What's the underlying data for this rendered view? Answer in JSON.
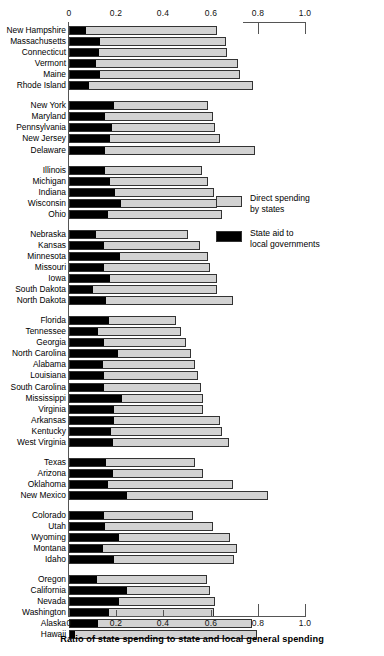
{
  "chart_data": {
    "type": "bar",
    "orientation": "horizontal",
    "stacked": true,
    "title": "",
    "xlabel": "Ratio of state spending to state and local general spending",
    "ylabel": "",
    "xlim": [
      0,
      1.0
    ],
    "xticks": [
      0,
      0.2,
      0.4,
      0.6,
      0.8,
      1.0
    ],
    "xticklabels": [
      "0",
      "0.2",
      "0.4",
      "0.6",
      "0.8",
      "1.0"
    ],
    "grid": false,
    "legend_position": "right-middle",
    "series": [
      {
        "name": "Direct spending by states",
        "color": "#d2d2d2"
      },
      {
        "name": "State aid to local governments",
        "color": "#000000"
      }
    ],
    "groups": [
      {
        "name": "New England",
        "rows": [
          {
            "label": "New Hampshire",
            "aid": 0.068,
            "total": 0.627
          },
          {
            "label": "Massachusetts",
            "aid": 0.13,
            "total": 0.665
          },
          {
            "label": "Connecticut",
            "aid": 0.123,
            "total": 0.669
          },
          {
            "label": "Vermont",
            "aid": 0.11,
            "total": 0.716
          },
          {
            "label": "Maine",
            "aid": 0.13,
            "total": 0.724
          },
          {
            "label": "Rhode Island",
            "aid": 0.08,
            "total": 0.78
          }
        ]
      },
      {
        "name": "Mid-Atlantic",
        "rows": [
          {
            "label": "New York",
            "aid": 0.19,
            "total": 0.59
          },
          {
            "label": "Maryland",
            "aid": 0.15,
            "total": 0.61
          },
          {
            "label": "Pennsylvania",
            "aid": 0.18,
            "total": 0.62
          },
          {
            "label": "New Jersey",
            "aid": 0.17,
            "total": 0.64
          },
          {
            "label": "Delaware",
            "aid": 0.15,
            "total": 0.79
          }
        ]
      },
      {
        "name": "Great Lakes",
        "rows": [
          {
            "label": "Illinois",
            "aid": 0.15,
            "total": 0.565
          },
          {
            "label": "Michigan",
            "aid": 0.17,
            "total": 0.59
          },
          {
            "label": "Indiana",
            "aid": 0.195,
            "total": 0.615
          },
          {
            "label": "Wisconsin",
            "aid": 0.22,
            "total": 0.625
          },
          {
            "label": "Ohio",
            "aid": 0.165,
            "total": 0.65
          }
        ]
      },
      {
        "name": "Plains",
        "rows": [
          {
            "label": "Nebraska",
            "aid": 0.11,
            "total": 0.504
          },
          {
            "label": "Kansas",
            "aid": 0.145,
            "total": 0.555
          },
          {
            "label": "Minnesota",
            "aid": 0.216,
            "total": 0.59
          },
          {
            "label": "Missouri",
            "aid": 0.145,
            "total": 0.597
          },
          {
            "label": "Iowa",
            "aid": 0.17,
            "total": 0.627
          },
          {
            "label": "South Dakota",
            "aid": 0.097,
            "total": 0.627
          },
          {
            "label": "North Dakota",
            "aid": 0.153,
            "total": 0.695
          }
        ]
      },
      {
        "name": "South",
        "rows": [
          {
            "label": "Florida",
            "aid": 0.17,
            "total": 0.453
          },
          {
            "label": "Tennessee",
            "aid": 0.12,
            "total": 0.475
          },
          {
            "label": "Georgia",
            "aid": 0.148,
            "total": 0.495
          },
          {
            "label": "North Carolina",
            "aid": 0.205,
            "total": 0.515
          },
          {
            "label": "Alabama",
            "aid": 0.14,
            "total": 0.535
          },
          {
            "label": "Louisiana",
            "aid": 0.148,
            "total": 0.545
          },
          {
            "label": "South Carolina",
            "aid": 0.148,
            "total": 0.56
          },
          {
            "label": "Mississippi",
            "aid": 0.222,
            "total": 0.568
          },
          {
            "label": "Virginia",
            "aid": 0.19,
            "total": 0.568
          },
          {
            "label": "Arkansas",
            "aid": 0.19,
            "total": 0.64
          },
          {
            "label": "Kentucky",
            "aid": 0.178,
            "total": 0.65
          },
          {
            "label": "West Virginia",
            "aid": 0.185,
            "total": 0.678
          }
        ]
      },
      {
        "name": "Southwest",
        "rows": [
          {
            "label": "Texas",
            "aid": 0.153,
            "total": 0.534
          },
          {
            "label": "Arizona",
            "aid": 0.186,
            "total": 0.568
          },
          {
            "label": "Oklahoma",
            "aid": 0.165,
            "total": 0.695
          },
          {
            "label": "New Mexico",
            "aid": 0.246,
            "total": 0.843
          }
        ]
      },
      {
        "name": "Mountain",
        "rows": [
          {
            "label": "Colorado",
            "aid": 0.145,
            "total": 0.525
          },
          {
            "label": "Utah",
            "aid": 0.15,
            "total": 0.61
          },
          {
            "label": "Wyoming",
            "aid": 0.21,
            "total": 0.68
          },
          {
            "label": "Montana",
            "aid": 0.143,
            "total": 0.71
          },
          {
            "label": "Idaho",
            "aid": 0.19,
            "total": 0.7
          }
        ]
      },
      {
        "name": "Pacific",
        "rows": [
          {
            "label": "Oregon",
            "aid": 0.118,
            "total": 0.585
          },
          {
            "label": "California",
            "aid": 0.246,
            "total": 0.597
          },
          {
            "label": "Nevada",
            "aid": 0.21,
            "total": 0.62
          },
          {
            "label": "Washington",
            "aid": 0.166,
            "total": 0.615
          },
          {
            "label": "Alaska",
            "aid": 0.12,
            "total": 0.775
          },
          {
            "label": "Hawaii",
            "aid": 0.02,
            "total": 0.797
          }
        ]
      }
    ]
  },
  "legend": {
    "gray_swatch_name": "direct-spending-swatch",
    "gray_label_line1": "Direct spending",
    "gray_label_line2": "by states",
    "black_swatch_name": "state-aid-swatch",
    "black_label_line1": "State aid to",
    "black_label_line2": "local governments"
  },
  "axis": {
    "xlabel": "Ratio of state spending to state and local general spending",
    "t0": "0",
    "t1": "0.2",
    "t2": "0.4",
    "t3": "0.6",
    "t4": "0.8",
    "t5": "1.0",
    "b0": "0",
    "b1": "0.2",
    "b2": "0.4",
    "b3": "0.6",
    "b4": "0.8",
    "b5": "1.0"
  }
}
